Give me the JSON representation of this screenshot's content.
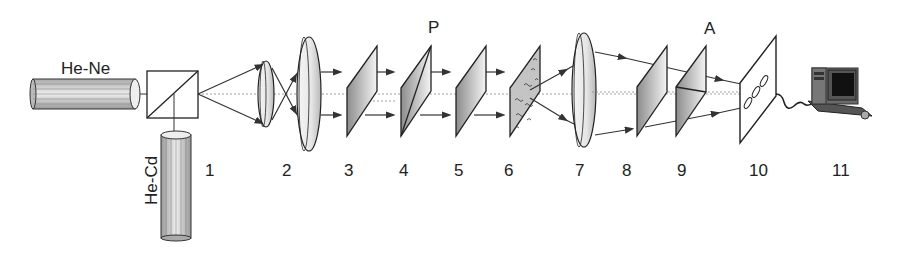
{
  "diagram": {
    "type": "optical-setup",
    "sources": [
      {
        "id": "he-ne",
        "label": "He-Ne"
      },
      {
        "id": "he-cd",
        "label": "He-Cd"
      }
    ],
    "markers": {
      "polarizer": "P",
      "analyzer": "A"
    },
    "components": [
      {
        "number": "1",
        "description": "beam splitter cube"
      },
      {
        "number": "2",
        "description": "beam expander lenses"
      },
      {
        "number": "3",
        "description": "plate"
      },
      {
        "number": "4",
        "description": "polarizer plate"
      },
      {
        "number": "5",
        "description": "plate"
      },
      {
        "number": "6",
        "description": "sample plate with scattering elements"
      },
      {
        "number": "7",
        "description": "lens"
      },
      {
        "number": "8",
        "description": "plate"
      },
      {
        "number": "9",
        "description": "analyzer plate"
      },
      {
        "number": "10",
        "description": "CCD screen"
      },
      {
        "number": "11",
        "description": "computer"
      }
    ],
    "ccd_label": "CCD",
    "colors": {
      "line": "#222222",
      "fill_light": "#f0f0f0",
      "fill_dark": "#9a9a9a",
      "background": "#ffffff"
    }
  }
}
